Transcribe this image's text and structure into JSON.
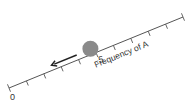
{
  "diagram": {
    "axis": {
      "label": "Frequency of A",
      "min_label": "0",
      "mid_label": ".5",
      "min": 0,
      "max": 1,
      "tick_step": 0.1,
      "start": [
        9,
        88
      ],
      "end": [
        183,
        17
      ],
      "color": "#555555"
    },
    "ball": {
      "position": 0.48,
      "color": "#8a8a8a",
      "radius": 8
    },
    "arrow": {
      "direction": "toward 0",
      "color": "#222222"
    }
  }
}
